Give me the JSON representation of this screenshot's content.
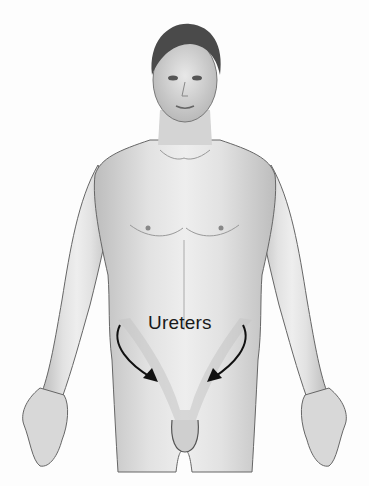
{
  "figure": {
    "labels": [
      {
        "text": "Ureters",
        "x": 148,
        "y": 312
      }
    ],
    "arrows": [
      {
        "from": [
          120,
          325
        ],
        "to": [
          158,
          382
        ],
        "direction": "down-right"
      },
      {
        "from": [
          243,
          325
        ],
        "to": [
          207,
          382
        ],
        "direction": "down-left"
      }
    ],
    "highlight_region": "ureters pathway (lighter shaded band from abdomen to bladder)",
    "colors": {
      "background": "#fdfdfd",
      "skin_light": "#e6e6e6",
      "skin_mid": "#c9c9c9",
      "outline": "#555555",
      "hair": "#4a4a4a",
      "label": "#1a1a1a"
    }
  }
}
